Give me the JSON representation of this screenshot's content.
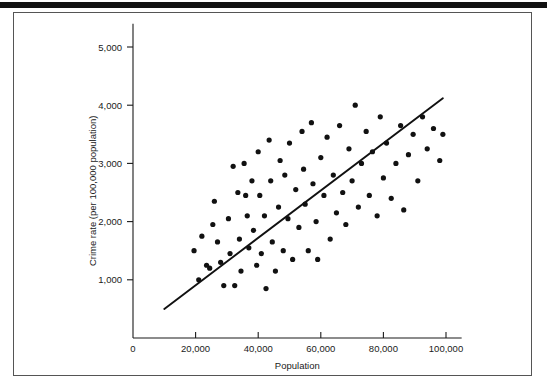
{
  "figure": {
    "top_rule": "decorative-black-rule",
    "frame": "thin-rectangular-border"
  },
  "chart_data": {
    "type": "scatter",
    "title": "",
    "xlabel": "Population",
    "ylabel": "Crime rate (per 100,000 population)",
    "xlim": [
      0,
      105000
    ],
    "ylim": [
      0,
      5400
    ],
    "grid": false,
    "legend": "none",
    "xticks": [
      0,
      20000,
      40000,
      60000,
      80000,
      100000
    ],
    "xtick_labels": [
      "0",
      "20,000",
      "40,000",
      "60,000",
      "80,000",
      "100,000"
    ],
    "yticks": [
      1000,
      2000,
      3000,
      4000,
      5000
    ],
    "ytick_labels": [
      "1,000",
      "2,000",
      "3,000",
      "4,000",
      "5,000"
    ],
    "annotations": [],
    "trend_line": {
      "label": "least-squares regression line",
      "x": [
        10000,
        99000
      ],
      "y": [
        500,
        4120
      ]
    },
    "points": [
      {
        "x": 19500,
        "y": 1500
      },
      {
        "x": 21000,
        "y": 1000
      },
      {
        "x": 22000,
        "y": 1750
      },
      {
        "x": 23500,
        "y": 1250
      },
      {
        "x": 24500,
        "y": 1200
      },
      {
        "x": 25500,
        "y": 1950
      },
      {
        "x": 26000,
        "y": 2350
      },
      {
        "x": 27000,
        "y": 1650
      },
      {
        "x": 28000,
        "y": 1300
      },
      {
        "x": 29000,
        "y": 900
      },
      {
        "x": 30500,
        "y": 2050
      },
      {
        "x": 31000,
        "y": 1450
      },
      {
        "x": 32000,
        "y": 2950
      },
      {
        "x": 32500,
        "y": 900
      },
      {
        "x": 33500,
        "y": 2500
      },
      {
        "x": 34000,
        "y": 1700
      },
      {
        "x": 34500,
        "y": 1150
      },
      {
        "x": 35500,
        "y": 3000
      },
      {
        "x": 36000,
        "y": 2450
      },
      {
        "x": 36500,
        "y": 2100
      },
      {
        "x": 37000,
        "y": 1550
      },
      {
        "x": 38000,
        "y": 2700
      },
      {
        "x": 38500,
        "y": 1850
      },
      {
        "x": 39500,
        "y": 1250
      },
      {
        "x": 40000,
        "y": 3200
      },
      {
        "x": 40500,
        "y": 2450
      },
      {
        "x": 41000,
        "y": 1450
      },
      {
        "x": 42000,
        "y": 2100
      },
      {
        "x": 42500,
        "y": 850
      },
      {
        "x": 43500,
        "y": 3400
      },
      {
        "x": 44000,
        "y": 2700
      },
      {
        "x": 44500,
        "y": 1650
      },
      {
        "x": 45500,
        "y": 1150
      },
      {
        "x": 46500,
        "y": 2250
      },
      {
        "x": 47000,
        "y": 3050
      },
      {
        "x": 48000,
        "y": 1500
      },
      {
        "x": 48500,
        "y": 2800
      },
      {
        "x": 49500,
        "y": 2050
      },
      {
        "x": 50000,
        "y": 3350
      },
      {
        "x": 51000,
        "y": 1350
      },
      {
        "x": 52000,
        "y": 2550
      },
      {
        "x": 53000,
        "y": 1900
      },
      {
        "x": 54000,
        "y": 3550
      },
      {
        "x": 54500,
        "y": 2900
      },
      {
        "x": 55000,
        "y": 2300
      },
      {
        "x": 56000,
        "y": 1500
      },
      {
        "x": 57000,
        "y": 3700
      },
      {
        "x": 57500,
        "y": 2650
      },
      {
        "x": 58500,
        "y": 2000
      },
      {
        "x": 59000,
        "y": 1350
      },
      {
        "x": 60000,
        "y": 3100
      },
      {
        "x": 61000,
        "y": 2450
      },
      {
        "x": 62000,
        "y": 3450
      },
      {
        "x": 63000,
        "y": 1700
      },
      {
        "x": 64000,
        "y": 2800
      },
      {
        "x": 65000,
        "y": 2150
      },
      {
        "x": 66000,
        "y": 3650
      },
      {
        "x": 67000,
        "y": 2500
      },
      {
        "x": 68000,
        "y": 1950
      },
      {
        "x": 69000,
        "y": 3250
      },
      {
        "x": 70000,
        "y": 2700
      },
      {
        "x": 71000,
        "y": 4000
      },
      {
        "x": 72000,
        "y": 2250
      },
      {
        "x": 73000,
        "y": 3000
      },
      {
        "x": 74500,
        "y": 3550
      },
      {
        "x": 75500,
        "y": 2450
      },
      {
        "x": 76500,
        "y": 3200
      },
      {
        "x": 78000,
        "y": 2100
      },
      {
        "x": 79000,
        "y": 3800
      },
      {
        "x": 80000,
        "y": 2750
      },
      {
        "x": 81000,
        "y": 3350
      },
      {
        "x": 82500,
        "y": 2400
      },
      {
        "x": 84000,
        "y": 3000
      },
      {
        "x": 85500,
        "y": 3650
      },
      {
        "x": 86500,
        "y": 2200
      },
      {
        "x": 88000,
        "y": 3150
      },
      {
        "x": 89500,
        "y": 3500
      },
      {
        "x": 91000,
        "y": 2700
      },
      {
        "x": 92500,
        "y": 3800
      },
      {
        "x": 94000,
        "y": 3250
      },
      {
        "x": 96000,
        "y": 3600
      },
      {
        "x": 98000,
        "y": 3050
      },
      {
        "x": 99000,
        "y": 3500
      }
    ]
  }
}
